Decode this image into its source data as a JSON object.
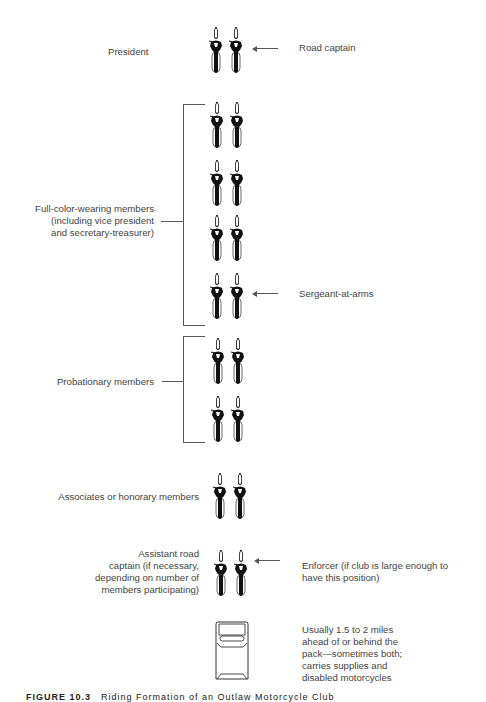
{
  "diagram": {
    "rows": [
      {
        "id": "president-row",
        "left_label": "President",
        "right_label": "Road captain",
        "bikes": 2
      },
      {
        "id": "full-color-1",
        "bikes": 2
      },
      {
        "id": "full-color-2",
        "bikes": 2
      },
      {
        "id": "full-color-3",
        "bikes": 2
      },
      {
        "id": "full-color-4",
        "bikes": 2,
        "right_label": "Sergeant-at-arms"
      },
      {
        "id": "probationary-1",
        "bikes": 2
      },
      {
        "id": "probationary-2",
        "bikes": 2
      },
      {
        "id": "associates-row",
        "left_label": "Associates or honorary members",
        "bikes": 2
      },
      {
        "id": "assistant-row",
        "left_label": "Assistant road captain (if necessary, depending on number of members participating)",
        "right_label": "Enforcer (if club is large enough to have this position)",
        "bikes": 2
      },
      {
        "id": "chase-vehicle",
        "right_label": "Usually 1.5 to 2 miles ahead of or behind the pack—sometimes both; carries supplies and disabled motorcycles"
      }
    ],
    "groups": [
      {
        "label_lines": [
          "Full-color-wearing members",
          "(including vice president",
          "and secretary-treasurer)"
        ]
      },
      {
        "label": "Probationary members"
      }
    ],
    "labels": {
      "president": "President",
      "road_captain": "Road captain",
      "full_color_1": "Full-color-wearing members",
      "full_color_2": "(including vice president",
      "full_color_3": "and secretary-treasurer)",
      "sergeant": "Sergeant-at-arms",
      "probationary": "Probationary members",
      "associates": "Associates or honorary members",
      "assistant_1": "Assistant road",
      "assistant_2": "captain (if necessary,",
      "assistant_3": "depending on number of",
      "assistant_4": "members participating)",
      "enforcer_1": "Enforcer (if club is large enough to",
      "enforcer_2": "have this position)",
      "vehicle_1": "Usually 1.5 to 2 miles",
      "vehicle_2": "ahead of or behind the",
      "vehicle_3": "pack—sometimes both;",
      "vehicle_4": "carries supplies and",
      "vehicle_5": "disabled motorcycles"
    },
    "caption": {
      "figure": "FIGURE 10.3",
      "text": "Riding Formation of an Outlaw Motorcycle Club"
    }
  }
}
